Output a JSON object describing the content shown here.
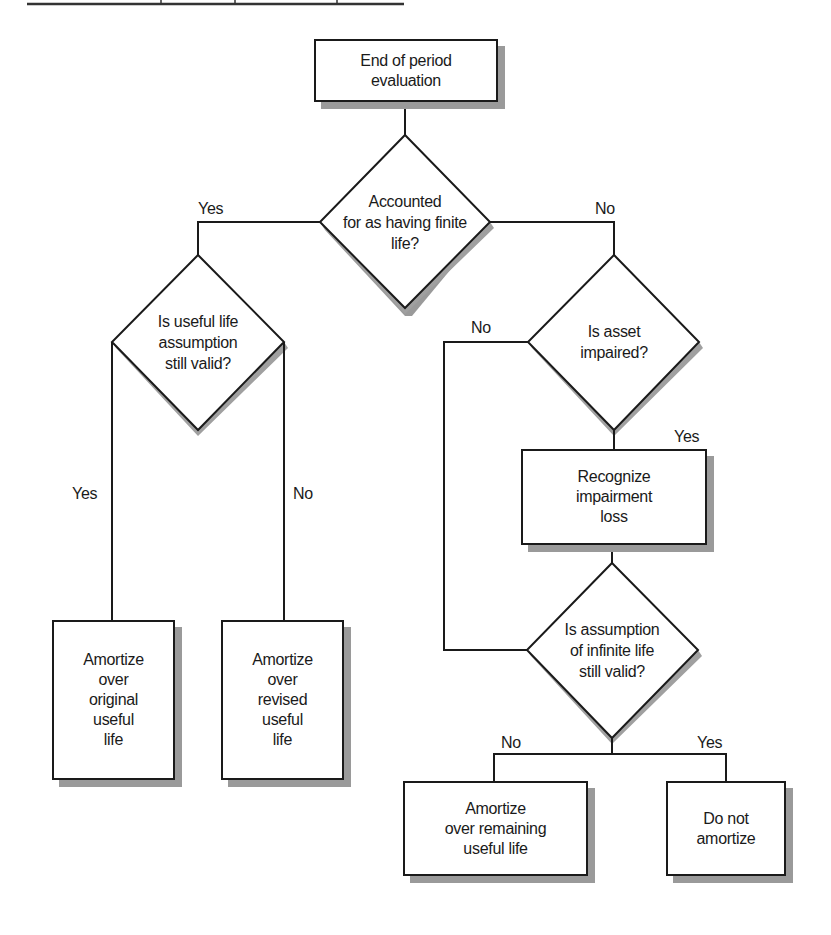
{
  "flowchart": {
    "nodes": {
      "start": {
        "type": "process",
        "label": "End of period\nevaluation"
      },
      "finite_life": {
        "type": "decision",
        "label": "Accounted\nfor as having finite\nlife?"
      },
      "useful_life_valid": {
        "type": "decision",
        "label": "Is useful life\nassumption\nstill valid?"
      },
      "asset_impaired": {
        "type": "decision",
        "label": "Is asset\nimpaired?"
      },
      "recognize_loss": {
        "type": "process",
        "label": "Recognize\nimpairment\nloss"
      },
      "infinite_life_valid": {
        "type": "decision",
        "label": "Is assumption\nof infinite life\nstill valid?"
      },
      "amortize_original": {
        "type": "process",
        "label": "Amortize\nover\noriginal\nuseful\nlife"
      },
      "amortize_revised": {
        "type": "process",
        "label": "Amortize\nover\nrevised\nuseful\nlife"
      },
      "amortize_remaining": {
        "type": "process",
        "label": "Amortize\nover remaining\nuseful life"
      },
      "do_not_amortize": {
        "type": "process",
        "label": "Do not\namortize"
      }
    },
    "edge_labels": {
      "finite_yes": "Yes",
      "finite_no": "No",
      "useful_yes": "Yes",
      "useful_no": "No",
      "impaired_no": "No",
      "impaired_yes": "Yes",
      "infinite_no": "No",
      "infinite_yes": "Yes"
    },
    "edges": [
      {
        "from": "start",
        "to": "finite_life"
      },
      {
        "from": "finite_life",
        "to": "useful_life_valid",
        "label": "Yes"
      },
      {
        "from": "finite_life",
        "to": "asset_impaired",
        "label": "No"
      },
      {
        "from": "useful_life_valid",
        "to": "amortize_original",
        "label": "Yes"
      },
      {
        "from": "useful_life_valid",
        "to": "amortize_revised",
        "label": "No"
      },
      {
        "from": "asset_impaired",
        "to": "recognize_loss",
        "label": "Yes"
      },
      {
        "from": "asset_impaired",
        "to": "infinite_life_valid",
        "label": "No"
      },
      {
        "from": "recognize_loss",
        "to": "infinite_life_valid"
      },
      {
        "from": "infinite_life_valid",
        "to": "amortize_remaining",
        "label": "No"
      },
      {
        "from": "infinite_life_valid",
        "to": "do_not_amortize",
        "label": "Yes"
      }
    ]
  }
}
